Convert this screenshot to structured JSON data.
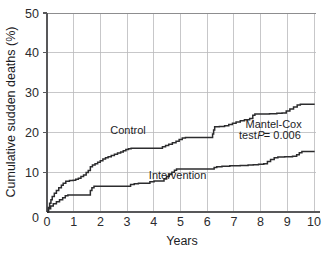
{
  "chart_data": {
    "type": "line",
    "title": "",
    "subtitle": "",
    "xlabel": "Years",
    "ylabel": "Cumulative sudden deaths (%)",
    "xlim": [
      0,
      10.3
    ],
    "ylim": [
      0,
      50
    ],
    "xticks": [
      "0",
      "1",
      "2",
      "3",
      "4",
      "5",
      "6",
      "7",
      "8",
      "9",
      "10"
    ],
    "xtick_values": [
      0,
      1,
      2,
      3,
      4,
      5,
      6,
      7,
      8,
      9,
      10
    ],
    "yticks": [
      "0",
      "10",
      "20",
      "30",
      "40",
      "50"
    ],
    "ytick_values": [
      0,
      10,
      20,
      30,
      40,
      50
    ],
    "grid": "both",
    "legend_position": "inline-labels",
    "annotations": [
      {
        "name": "mantel-cox-line1",
        "text": "Mantel-Cox",
        "x": 7.6,
        "y": 21.2
      },
      {
        "name": "mantel-cox-line2-prefix",
        "text": "test ",
        "x": 7.35,
        "y": 18.3
      },
      {
        "name": "mantel-cox-line2-statistic",
        "text": "P",
        "x": 8.05,
        "y": 18.3
      },
      {
        "name": "mantel-cox-line2-suffix",
        "text": "= 0.006",
        "x": 8.3,
        "y": 18.3
      }
    ],
    "series": [
      {
        "name": "Control",
        "label": "Control",
        "label_x": 3.1,
        "label_y": 19.6,
        "color": "#2c2c2e",
        "points": [
          [
            0.0,
            0.0
          ],
          [
            0.05,
            1.1
          ],
          [
            0.1,
            2.2
          ],
          [
            0.15,
            3.1
          ],
          [
            0.2,
            3.9
          ],
          [
            0.28,
            4.7
          ],
          [
            0.36,
            5.4
          ],
          [
            0.45,
            6.1
          ],
          [
            0.55,
            6.7
          ],
          [
            0.62,
            7.2
          ],
          [
            0.72,
            7.7
          ],
          [
            0.86,
            7.9
          ],
          [
            1.0,
            8.0
          ],
          [
            1.1,
            8.2
          ],
          [
            1.2,
            8.5
          ],
          [
            1.3,
            8.9
          ],
          [
            1.4,
            9.3
          ],
          [
            1.5,
            9.9
          ],
          [
            1.58,
            10.4
          ],
          [
            1.66,
            11.4
          ],
          [
            1.74,
            11.8
          ],
          [
            1.84,
            12.1
          ],
          [
            1.94,
            12.5
          ],
          [
            2.04,
            12.9
          ],
          [
            2.14,
            13.3
          ],
          [
            2.24,
            13.6
          ],
          [
            2.34,
            13.9
          ],
          [
            2.46,
            14.2
          ],
          [
            2.58,
            14.5
          ],
          [
            2.7,
            14.8
          ],
          [
            2.82,
            15.1
          ],
          [
            2.92,
            15.4
          ],
          [
            3.02,
            15.7
          ],
          [
            3.12,
            15.9
          ],
          [
            3.22,
            16.0
          ],
          [
            4.3,
            16.0
          ],
          [
            4.42,
            16.4
          ],
          [
            4.54,
            16.7
          ],
          [
            4.66,
            17.0
          ],
          [
            4.8,
            17.4
          ],
          [
            4.94,
            17.8
          ],
          [
            5.06,
            18.2
          ],
          [
            5.18,
            18.6
          ],
          [
            5.3,
            18.7
          ],
          [
            6.28,
            18.7
          ],
          [
            6.34,
            19.6
          ],
          [
            6.38,
            20.6
          ],
          [
            6.42,
            21.4
          ],
          [
            6.6,
            21.5
          ],
          [
            6.8,
            21.7
          ],
          [
            6.96,
            22.0
          ],
          [
            7.1,
            22.3
          ],
          [
            7.24,
            22.6
          ],
          [
            7.4,
            22.9
          ],
          [
            7.56,
            23.2
          ],
          [
            7.76,
            23.5
          ],
          [
            7.88,
            24.3
          ],
          [
            7.96,
            24.6
          ],
          [
            8.2,
            24.6
          ],
          [
            8.52,
            24.7
          ],
          [
            8.8,
            24.8
          ],
          [
            9.0,
            24.9
          ],
          [
            9.16,
            25.4
          ],
          [
            9.3,
            25.9
          ],
          [
            9.44,
            26.4
          ],
          [
            9.58,
            26.9
          ],
          [
            9.7,
            27.1
          ],
          [
            10.25,
            27.1
          ]
        ]
      },
      {
        "name": "Intervention",
        "label": "Intervention",
        "label_x": 5.0,
        "label_y": 8.2,
        "color": "#2c2c2e",
        "points": [
          [
            0.0,
            0.0
          ],
          [
            0.06,
            0.8
          ],
          [
            0.14,
            1.5
          ],
          [
            0.24,
            2.1
          ],
          [
            0.36,
            2.6
          ],
          [
            0.48,
            3.1
          ],
          [
            0.6,
            3.6
          ],
          [
            0.7,
            4.1
          ],
          [
            0.8,
            4.3
          ],
          [
            1.58,
            4.3
          ],
          [
            1.66,
            5.4
          ],
          [
            1.72,
            6.1
          ],
          [
            1.8,
            6.5
          ],
          [
            3.08,
            6.5
          ],
          [
            3.2,
            6.9
          ],
          [
            3.34,
            7.1
          ],
          [
            3.5,
            7.2
          ],
          [
            3.8,
            7.2
          ],
          [
            3.94,
            7.6
          ],
          [
            4.1,
            7.8
          ],
          [
            4.34,
            7.8
          ],
          [
            4.48,
            8.3
          ],
          [
            4.58,
            8.9
          ],
          [
            4.68,
            9.4
          ],
          [
            4.78,
            10.0
          ],
          [
            4.88,
            10.5
          ],
          [
            4.96,
            10.8
          ],
          [
            6.28,
            10.8
          ],
          [
            6.4,
            11.2
          ],
          [
            6.5,
            11.4
          ],
          [
            6.7,
            11.5
          ],
          [
            7.0,
            11.6
          ],
          [
            7.4,
            11.7
          ],
          [
            7.7,
            11.8
          ],
          [
            7.9,
            11.9
          ],
          [
            8.1,
            12.0
          ],
          [
            8.3,
            12.1
          ],
          [
            8.44,
            12.7
          ],
          [
            8.56,
            13.2
          ],
          [
            8.7,
            13.6
          ],
          [
            8.84,
            13.8
          ],
          [
            9.1,
            13.9
          ],
          [
            9.4,
            14.0
          ],
          [
            9.56,
            14.4
          ],
          [
            9.66,
            14.9
          ],
          [
            9.76,
            15.2
          ],
          [
            10.25,
            15.2
          ]
        ]
      }
    ]
  },
  "figure": {
    "caption_partial": ""
  }
}
